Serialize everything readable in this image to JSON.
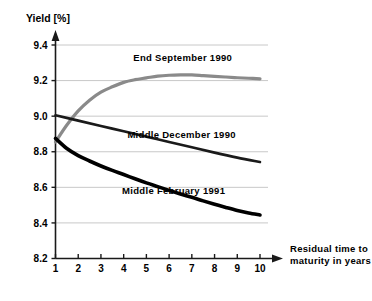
{
  "chart_data": {
    "type": "line",
    "title": "",
    "ylabel": "Yield [%]",
    "xlabel": "Residual time to maturity in years",
    "xlabel_line1": "Residual time to",
    "xlabel_line2": "maturity in years",
    "xlim": [
      1,
      10
    ],
    "ylim": [
      8.2,
      9.4
    ],
    "yticks": [
      "9.4",
      "9.2",
      "9.0",
      "8.8",
      "8.6",
      "8.4",
      "8.2"
    ],
    "ytick_values": [
      9.4,
      9.2,
      9.0,
      8.8,
      8.6,
      8.4,
      8.2
    ],
    "xticks": [
      "1",
      "2",
      "3",
      "4",
      "5",
      "6",
      "7",
      "8",
      "9",
      "10"
    ],
    "xtick_values": [
      1,
      2,
      3,
      4,
      5,
      6,
      7,
      8,
      9,
      10
    ],
    "grid": true,
    "grid_axis": "y",
    "grid_color": "#c8c8c8",
    "legend": "inline-labels",
    "series": [
      {
        "name": "End September 1990",
        "color": "#8a8a8a",
        "width": 3.2,
        "label_x": 6.6,
        "label_y": 9.31,
        "x": [
          1,
          1.5,
          2,
          2.5,
          3,
          3.5,
          4,
          4.5,
          5,
          5.5,
          6,
          6.5,
          7,
          7.5,
          8,
          8.5,
          9,
          9.5,
          10
        ],
        "values": [
          8.855,
          8.95,
          9.03,
          9.09,
          9.135,
          9.165,
          9.19,
          9.205,
          9.215,
          9.225,
          9.23,
          9.232,
          9.232,
          9.228,
          9.224,
          9.22,
          9.216,
          9.213,
          9.21
        ]
      },
      {
        "name": "Middle December 1990",
        "color": "#1a1a1a",
        "width": 2.6,
        "label_x": 6.55,
        "label_y": 8.88,
        "x": [
          1,
          2,
          3,
          4,
          5,
          6,
          7,
          8,
          9,
          10
        ],
        "values": [
          9.005,
          8.975,
          8.945,
          8.915,
          8.885,
          8.855,
          8.825,
          8.795,
          8.767,
          8.742
        ]
      },
      {
        "name": "Middle February 1991",
        "color": "#000000",
        "width": 3.6,
        "label_x": 6.2,
        "label_y": 8.56,
        "x": [
          1,
          1.5,
          2,
          2.5,
          3,
          3.5,
          4,
          4.5,
          5,
          5.5,
          6,
          6.5,
          7,
          7.5,
          8,
          8.5,
          9,
          9.5,
          10
        ],
        "values": [
          8.875,
          8.818,
          8.778,
          8.748,
          8.72,
          8.695,
          8.672,
          8.648,
          8.625,
          8.604,
          8.583,
          8.563,
          8.544,
          8.524,
          8.505,
          8.487,
          8.47,
          8.456,
          8.445
        ]
      }
    ]
  }
}
